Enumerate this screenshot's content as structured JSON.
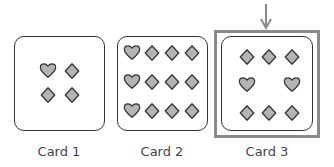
{
  "cards": [
    {
      "label": "Card 1",
      "hearts": 1,
      "diamonds": 3,
      "highlighted": false
    },
    {
      "label": "Card 2",
      "hearts": 3,
      "diamonds": 9,
      "highlighted": false
    },
    {
      "label": "Card 3",
      "hearts": 2,
      "diamonds": 6,
      "highlighted": true
    }
  ],
  "colors": {
    "symbol_fill": "#b4b4b4",
    "symbol_stroke": "#333333",
    "highlight_frame": "#8a8a8a",
    "arrow": "#8a8a8a"
  }
}
